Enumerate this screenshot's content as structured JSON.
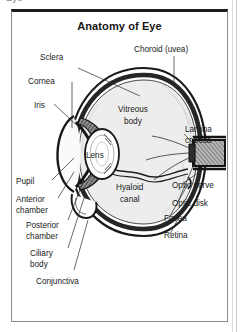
{
  "page": {
    "cropped_text_above": "Eye",
    "background_color": "#ffffff",
    "frame_border_color": "#8a8a8a",
    "frame_top_rule_color": "#1c1c1c"
  },
  "figure": {
    "title": "Anatomy of Eye",
    "ink_color": "#1a1a1a",
    "vitreous_fill": "#ededed",
    "sclera_fill": "#ffffff",
    "choroid_fill": "#3a3a3a"
  },
  "labels": {
    "left": [
      {
        "id": "sclera",
        "text": "Sclera"
      },
      {
        "id": "cornea",
        "text": "Cornea"
      },
      {
        "id": "iris",
        "text": "Iris"
      },
      {
        "id": "pupil",
        "text": "Pupil"
      },
      {
        "id": "anterior-chamber",
        "line1": "Anterior",
        "line2": "chamber"
      },
      {
        "id": "posterior-chamber",
        "line1": "Posterior",
        "line2": "chamber"
      },
      {
        "id": "ciliary-body",
        "line1": "Ciliary",
        "line2": "body"
      },
      {
        "id": "conjunctiva",
        "text": "Conjunctiva"
      }
    ],
    "right": [
      {
        "id": "choroid",
        "text": "Choroid (uvea)"
      },
      {
        "id": "lamina-cribosa",
        "line1": "Lamina",
        "line2": "cribosa"
      },
      {
        "id": "optic-nerve",
        "text": "Optic nerve"
      },
      {
        "id": "optic-disk",
        "text": "Optic disk"
      },
      {
        "id": "fovea",
        "text": "Fovea"
      },
      {
        "id": "retina",
        "text": "Retina"
      }
    ],
    "interior": [
      {
        "id": "vitreous-body",
        "line1": "Vitreous",
        "line2": "body"
      },
      {
        "id": "hyaloid-canal",
        "line1": "Hyaloid",
        "line2": "canal"
      },
      {
        "id": "lens",
        "text": "Lens"
      }
    ]
  }
}
